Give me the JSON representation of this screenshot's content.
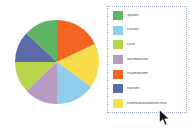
{
  "chart_data": {
    "type": "pie",
    "title": "",
    "legend_position": "right",
    "start_angle_deg": 0,
    "direction": "clockwise",
    "categories": [
      "Raumwärme",
      "Kommunikationstechnik",
      "Kühlen",
      "Warmwasser",
      "Licht",
      "Kochen",
      "Spülen"
    ],
    "values": [
      18,
      17,
      15,
      13,
      12,
      12,
      13
    ],
    "colors": [
      "#f26522",
      "#f7dd4a",
      "#8fcdea",
      "#b79cc0",
      "#b7d44a",
      "#5b6aa8",
      "#5bb playfulness"
    ],
    "slices": [
      {
        "label": "Raumwärme",
        "value": 18,
        "color": "#f26522"
      },
      {
        "label": "Kommunikationstechnik",
        "value": 17,
        "color": "#f7dd4a"
      },
      {
        "label": "Kühlen",
        "value": 15,
        "color": "#8fcdea"
      },
      {
        "label": "Warmwasser",
        "value": 13,
        "color": "#b79cc0"
      },
      {
        "label": "Licht",
        "value": 12,
        "color": "#b7d44a"
      },
      {
        "label": "Kochen",
        "value": 12,
        "color": "#5b6aa8"
      },
      {
        "label": "Spülen",
        "value": 13,
        "color": "#5fb564"
      }
    ],
    "geometry": {
      "cx": 44,
      "cy": 44,
      "r": 42
    }
  },
  "legend": {
    "items": [
      {
        "label": "Spülen",
        "color": "#5fb564"
      },
      {
        "label": "Kühlen",
        "color": "#8fcdea"
      },
      {
        "label": "Licht",
        "color": "#b7d44a"
      },
      {
        "label": "Warmwasser",
        "color": "#b79cc0"
      },
      {
        "label": "Raumwärme",
        "color": "#f26522"
      },
      {
        "label": "Kochen",
        "color": "#5b6aa8"
      },
      {
        "label": "Kommunikationstechnik",
        "color": "#f7dd4a"
      }
    ],
    "selected": true,
    "border_color": "#9aa8c4"
  },
  "cursor": {
    "icon": "arrow-pointer",
    "x": 158,
    "y": 108
  },
  "canvas": {
    "background": "#ffffff",
    "width": 190,
    "height": 140
  }
}
